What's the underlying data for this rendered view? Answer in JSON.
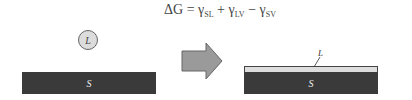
{
  "equation": {
    "lhs": "ΔG",
    "eq": " = ",
    "t1": "γ",
    "s1": "SL",
    "op1": " + ",
    "t2": "γ",
    "s2": "LV",
    "op2": " − ",
    "t3": "γ",
    "s3": "SV"
  },
  "left": {
    "droplet_label": "L",
    "solid_label": "S"
  },
  "right": {
    "film_label": "L",
    "solid_label": "S"
  },
  "colors": {
    "solid": "#3a3a3a",
    "liquid": "#dcdcdc",
    "arrow": "#9a9a9a"
  }
}
